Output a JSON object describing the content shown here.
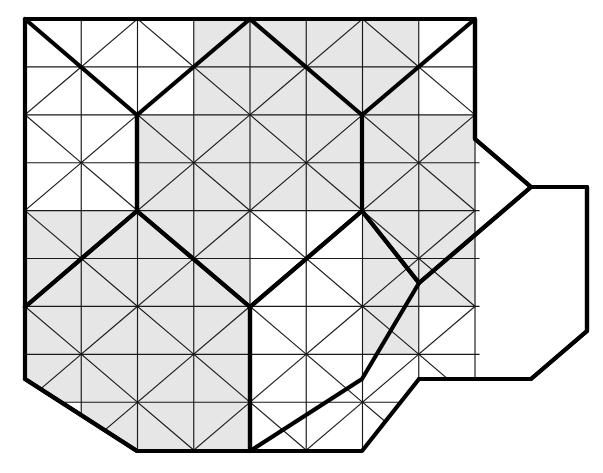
{
  "figure": {
    "title": "Isometric triangular grid with bold hexagonal region outlines",
    "type": "geometric-diagram",
    "canvas": {
      "width": 603,
      "height": 473,
      "background": "#ffffff"
    },
    "grid": {
      "origin_x": 25,
      "origin_y": 19,
      "col_pitch": 56.25,
      "row_pitch": 47.9,
      "cols": 8,
      "rows": 9,
      "thin_stroke_color": "#1a1a1a",
      "thin_stroke_width": 1.15,
      "bold_stroke_color": "#000000",
      "bold_stroke_width": 4.2,
      "shade_color": "#e6e6e6",
      "white_color": "#ffffff"
    },
    "shaded_cells": [
      [
        3,
        0
      ],
      [
        4,
        0
      ],
      [
        5,
        0
      ],
      [
        6,
        0
      ],
      [
        3,
        1
      ],
      [
        4,
        1
      ],
      [
        5,
        1
      ],
      [
        6,
        1
      ],
      [
        2,
        2
      ],
      [
        3,
        2
      ],
      [
        4,
        2
      ],
      [
        5,
        2
      ],
      [
        6,
        2
      ],
      [
        7,
        2
      ],
      [
        2,
        3
      ],
      [
        3,
        3
      ],
      [
        4,
        3
      ],
      [
        5,
        3
      ],
      [
        6,
        3
      ],
      [
        7,
        3
      ],
      [
        0,
        4
      ],
      [
        1,
        4
      ],
      [
        2,
        4
      ],
      [
        3,
        4
      ],
      [
        6,
        4
      ],
      [
        7,
        4
      ],
      [
        0,
        5
      ],
      [
        1,
        5
      ],
      [
        2,
        5
      ],
      [
        3,
        5
      ],
      [
        6,
        5
      ],
      [
        7,
        5
      ],
      [
        0,
        6
      ],
      [
        1,
        6
      ],
      [
        2,
        6
      ],
      [
        3,
        6
      ],
      [
        6,
        6
      ],
      [
        0,
        7
      ],
      [
        1,
        7
      ],
      [
        2,
        7
      ],
      [
        3,
        7
      ],
      [
        1,
        8
      ],
      [
        2,
        8
      ],
      [
        3,
        8
      ]
    ],
    "outer_boundary": [
      [
        25,
        19
      ],
      [
        475,
        19
      ],
      [
        475,
        139
      ],
      [
        531,
        187
      ],
      [
        587,
        187
      ],
      [
        587,
        331
      ],
      [
        531,
        379
      ],
      [
        419,
        379
      ],
      [
        362,
        451
      ],
      [
        137,
        451
      ],
      [
        25,
        379
      ],
      [
        25,
        19
      ]
    ],
    "bold_regions": [
      {
        "name": "hexagon-upper-left",
        "points": [
          [
            25,
            19
          ],
          [
            137,
            115
          ],
          [
            137,
            211
          ],
          [
            25,
            307
          ]
        ],
        "closed": false
      },
      {
        "name": "hexagon-upper-center",
        "points": [
          [
            137,
            115
          ],
          [
            250,
            19
          ],
          [
            362,
            115
          ],
          [
            362,
            211
          ],
          [
            250,
            307
          ],
          [
            137,
            211
          ]
        ],
        "closed": true
      },
      {
        "name": "hexagon-upper-right",
        "points": [
          [
            362,
            115
          ],
          [
            475,
            19
          ],
          [
            475,
            139
          ],
          [
            531,
            187
          ],
          [
            419,
            283
          ],
          [
            362,
            211
          ]
        ],
        "closed": false
      },
      {
        "name": "hexagon-lower-center",
        "points": [
          [
            250,
            307
          ],
          [
            362,
            211
          ],
          [
            419,
            283
          ],
          [
            362,
            379
          ],
          [
            250,
            451
          ],
          [
            250,
            307
          ]
        ],
        "closed": true
      },
      {
        "name": "hexagon-lower-left",
        "points": [
          [
            25,
            307
          ],
          [
            137,
            211
          ],
          [
            250,
            307
          ],
          [
            250,
            451
          ],
          [
            137,
            451
          ],
          [
            25,
            379
          ]
        ],
        "closed": false
      },
      {
        "name": "hexagon-lower-right",
        "points": [
          [
            419,
            283
          ],
          [
            531,
            187
          ],
          [
            587,
            187
          ],
          [
            587,
            331
          ],
          [
            531,
            379
          ],
          [
            419,
            379
          ]
        ],
        "closed": false
      }
    ]
  }
}
